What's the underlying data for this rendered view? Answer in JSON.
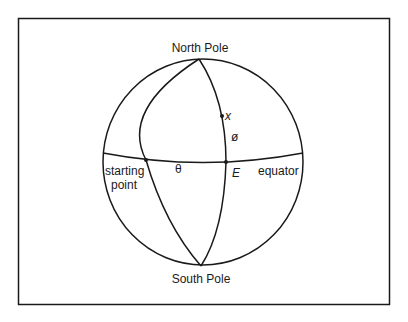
{
  "diagram": {
    "type": "globe-great-circles",
    "labels": {
      "north_pole": "North Pole",
      "south_pole": "South Pole",
      "starting_point_line1": "starting",
      "starting_point_line2": "point",
      "equator": "equator",
      "theta": "θ",
      "phi": "ø",
      "point_x": "x",
      "point_e": "E"
    },
    "colors": {
      "stroke": "#1a1a1a",
      "background": "#ffffff"
    }
  }
}
